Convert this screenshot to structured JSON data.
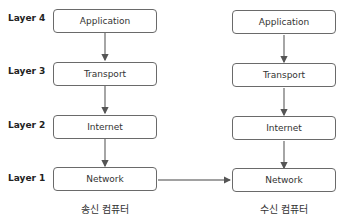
{
  "layers": [
    {
      "label": "Layer 4",
      "name": "Application"
    },
    {
      "label": "Layer 3",
      "name": "Transport"
    },
    {
      "label": "Layer 2",
      "name": "Internet"
    },
    {
      "label": "Layer 1",
      "name": "Network"
    }
  ],
  "sender": {
    "label": "송신 컴퓨터",
    "boxes": [
      "Application",
      "Transport",
      "Internet",
      "Network"
    ]
  },
  "receiver": {
    "label": "수신 컴퓨터",
    "boxes": [
      "Application",
      "Transport",
      "Internet",
      "Network"
    ]
  },
  "colors": {
    "line": "#6a6a6a",
    "box_border": "#6a6a6a",
    "text": "#333333"
  }
}
